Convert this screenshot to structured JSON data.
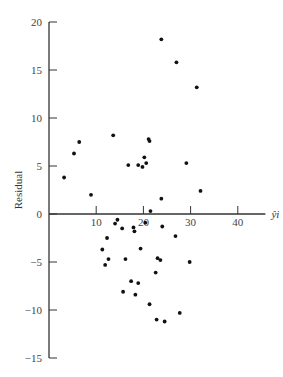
{
  "chart_data": {
    "type": "scatter",
    "title": "",
    "xlabel": "ŷi",
    "ylabel": "Residual",
    "xlim": [
      0,
      45
    ],
    "ylim": [
      -15,
      20
    ],
    "xticks": [
      10,
      20,
      30,
      40
    ],
    "xtick_labels": [
      "10",
      "20",
      "30",
      "40"
    ],
    "yticks": [
      20,
      15,
      10,
      5,
      0,
      -5,
      -10,
      -15
    ],
    "ytick_labels": [
      "20",
      "15",
      "10",
      "5",
      "0",
      "-5",
      "-10",
      "-15"
    ],
    "grid": false,
    "legend": "none",
    "series": [
      {
        "name": "residuals",
        "points": [
          [
            3.2,
            3.8
          ],
          [
            5.3,
            6.3
          ],
          [
            6.4,
            7.5
          ],
          [
            13.6,
            8.2
          ],
          [
            8.9,
            2.0
          ],
          [
            16.8,
            5.1
          ],
          [
            18.9,
            5.1
          ],
          [
            19.8,
            4.9
          ],
          [
            20.6,
            5.3
          ],
          [
            20.2,
            5.9
          ],
          [
            21.1,
            7.8
          ],
          [
            21.3,
            7.6
          ],
          [
            23.8,
            18.2
          ],
          [
            27.0,
            15.8
          ],
          [
            31.3,
            13.2
          ],
          [
            29.1,
            5.3
          ],
          [
            32.1,
            2.4
          ],
          [
            21.5,
            0.3
          ],
          [
            23.8,
            1.6
          ],
          [
            24.0,
            -1.3
          ],
          [
            26.8,
            -2.3
          ],
          [
            29.8,
            -5.0
          ],
          [
            14.5,
            -0.6
          ],
          [
            14.0,
            -1.0
          ],
          [
            15.5,
            -1.5
          ],
          [
            12.3,
            -2.5
          ],
          [
            17.9,
            -1.4
          ],
          [
            18.1,
            -1.8
          ],
          [
            20.4,
            -0.9
          ],
          [
            11.3,
            -3.7
          ],
          [
            12.6,
            -4.7
          ],
          [
            11.9,
            -5.3
          ],
          [
            16.2,
            -4.7
          ],
          [
            19.4,
            -3.6
          ],
          [
            23.0,
            -4.6
          ],
          [
            23.6,
            -4.8
          ],
          [
            22.6,
            -6.1
          ],
          [
            17.4,
            -7.0
          ],
          [
            18.9,
            -7.2
          ],
          [
            15.7,
            -8.1
          ],
          [
            18.3,
            -8.4
          ],
          [
            21.3,
            -9.4
          ],
          [
            22.8,
            -11.0
          ],
          [
            24.5,
            -11.2
          ],
          [
            27.7,
            -10.3
          ]
        ]
      }
    ]
  }
}
